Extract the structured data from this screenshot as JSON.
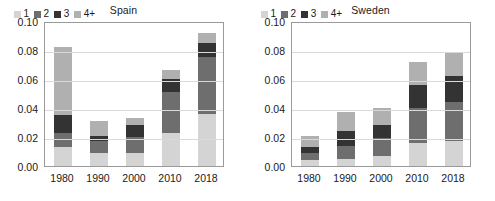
{
  "chart_data": [
    {
      "type": "bar",
      "title": "Spain",
      "xlabel": "",
      "ylabel": "",
      "categories": [
        "1980",
        "1990",
        "2000",
        "2010",
        "2018"
      ],
      "ylim": [
        0.0,
        0.1
      ],
      "yticks": [
        "0.00",
        "0.02",
        "0.04",
        "0.06",
        "0.08",
        "0.10"
      ],
      "ytick_values": [
        0.0,
        0.02,
        0.04,
        0.06,
        0.08,
        0.1
      ],
      "grid": true,
      "stacked": true,
      "legend_position": "top-left",
      "series": [
        {
          "name": "1",
          "color": "#d4d4d4",
          "values": [
            0.013,
            0.009,
            0.009,
            0.023,
            0.036
          ]
        },
        {
          "name": "2",
          "color": "#6e6e6e",
          "values": [
            0.01,
            0.008,
            0.011,
            0.028,
            0.039
          ]
        },
        {
          "name": "3",
          "color": "#333333",
          "values": [
            0.012,
            0.004,
            0.008,
            0.009,
            0.01
          ]
        },
        {
          "name": "4+",
          "color": "#b0b0b0",
          "values": [
            0.047,
            0.01,
            0.005,
            0.006,
            0.007
          ]
        }
      ],
      "totals": [
        0.082,
        0.031,
        0.033,
        0.066,
        0.092
      ]
    },
    {
      "type": "bar",
      "title": "Sweden",
      "xlabel": "",
      "ylabel": "",
      "categories": [
        "1980",
        "1990",
        "2000",
        "2010",
        "2018"
      ],
      "ylim": [
        0.0,
        0.1
      ],
      "yticks": [
        "0.00",
        "0.02",
        "0.04",
        "0.06",
        "0.08",
        "0.10"
      ],
      "ytick_values": [
        0.0,
        0.02,
        0.04,
        0.06,
        0.08,
        0.1
      ],
      "grid": true,
      "stacked": true,
      "legend_position": "top-left",
      "series": [
        {
          "name": "1",
          "color": "#d4d4d4",
          "values": [
            0.004,
            0.005,
            0.007,
            0.016,
            0.017
          ]
        },
        {
          "name": "2",
          "color": "#6e6e6e",
          "values": [
            0.005,
            0.009,
            0.012,
            0.024,
            0.027
          ]
        },
        {
          "name": "3",
          "color": "#333333",
          "values": [
            0.004,
            0.01,
            0.009,
            0.016,
            0.018
          ]
        },
        {
          "name": "4+",
          "color": "#b0b0b0",
          "values": [
            0.008,
            0.013,
            0.012,
            0.016,
            0.016
          ]
        }
      ],
      "totals": [
        0.021,
        0.037,
        0.04,
        0.072,
        0.078
      ]
    }
  ],
  "colors": {
    "series_1": "#d4d4d4",
    "series_2": "#6e6e6e",
    "series_3": "#333333",
    "series_4plus": "#b0b0b0",
    "gridline": "#d9d9d9",
    "axis": "#9a9a9a",
    "text": "#1a1a1a",
    "background": "#ffffff"
  }
}
